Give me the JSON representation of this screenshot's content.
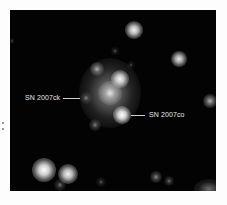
{
  "image": {
    "description": "Astronomical image of a galaxy with two supernovae labeled",
    "background_color": "#030303",
    "frame_color": "#fdfdfd"
  },
  "labels": {
    "sn_left": "SN 2007ck",
    "sn_right": "SN 2007co"
  },
  "objects": {
    "galaxy": {
      "x": 100,
      "y": 83,
      "w": 62,
      "h": 70
    },
    "stars": [
      {
        "name": "star-top",
        "x": 124,
        "y": 20,
        "r": 9,
        "b": 0.95
      },
      {
        "name": "star-upper-left",
        "x": 105,
        "y": 41,
        "r": 4,
        "b": 0.35
      },
      {
        "name": "star-upper-right",
        "x": 169,
        "y": 49,
        "r": 8,
        "b": 0.9
      },
      {
        "name": "star-small-mid",
        "x": 121,
        "y": 55,
        "r": 4,
        "b": 0.3
      },
      {
        "name": "star-galaxy-left",
        "x": 87,
        "y": 59,
        "r": 7,
        "b": 0.65
      },
      {
        "name": "star-galaxy-bright",
        "x": 110,
        "y": 69,
        "r": 9,
        "b": 0.95
      },
      {
        "name": "galaxy-core",
        "x": 100,
        "y": 83,
        "r": 12,
        "b": 0.7
      },
      {
        "name": "sn-2007ck",
        "x": 76,
        "y": 88,
        "r": 6,
        "b": 0.45
      },
      {
        "name": "sn-2007co",
        "x": 112,
        "y": 105,
        "r": 9,
        "b": 1.0
      },
      {
        "name": "star-lower-left",
        "x": 85,
        "y": 115,
        "r": 6,
        "b": 0.5
      },
      {
        "name": "star-right-edge",
        "x": 200,
        "y": 91,
        "r": 7,
        "b": 0.7
      },
      {
        "name": "star-bottom-bright",
        "x": 34,
        "y": 160,
        "r": 12,
        "b": 1.0
      },
      {
        "name": "star-bottom-second",
        "x": 58,
        "y": 164,
        "r": 10,
        "b": 0.95
      },
      {
        "name": "star-bottom-faint",
        "x": 50,
        "y": 175,
        "r": 6,
        "b": 0.45
      },
      {
        "name": "star-bottom-small",
        "x": 91,
        "y": 172,
        "r": 5,
        "b": 0.35
      },
      {
        "name": "star-bottom-right-1",
        "x": 146,
        "y": 167,
        "r": 6,
        "b": 0.55
      },
      {
        "name": "star-bottom-right-2",
        "x": 159,
        "y": 171,
        "r": 5,
        "b": 0.45
      },
      {
        "name": "star-left-edge",
        "x": 2,
        "y": 31,
        "r": 3,
        "b": 0.3
      }
    ]
  }
}
